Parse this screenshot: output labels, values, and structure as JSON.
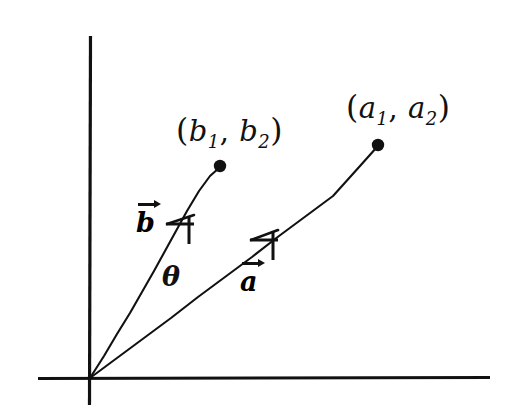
{
  "figure": {
    "kind": "vector-angle-diagram",
    "background_color": "#ffffff",
    "ink_color": "#111111",
    "width": 514,
    "height": 420
  },
  "axes": {
    "origin": {
      "x": 90,
      "y": 378
    },
    "x_axis": {
      "x1": 38,
      "y1": 378,
      "x2": 490,
      "y2": 378
    },
    "y_axis": {
      "x1": 90,
      "y1": 36,
      "x2": 90,
      "y2": 405
    }
  },
  "vectors": [
    {
      "id": "vector-b",
      "name": "b",
      "label": "b",
      "label_x": 136,
      "label_y": 203,
      "tip": {
        "x": 220,
        "y": 167
      },
      "point_label": {
        "open_paren": "(",
        "base1": "b",
        "sub1": "1",
        "comma": ",",
        "base2": "b",
        "sub2": "2",
        "close_paren": ")",
        "x": 176,
        "y": 115
      },
      "arrowhead": {
        "x": 185,
        "y": 228
      }
    },
    {
      "id": "vector-a",
      "name": "a",
      "label": "a",
      "label_x": 240,
      "label_y": 262,
      "tip": {
        "x": 378,
        "y": 145
      },
      "point_label": {
        "open_paren": "(",
        "base1": "a",
        "sub1": "1",
        "comma": ",",
        "base2": "a",
        "sub2": "2",
        "close_paren": ")",
        "x": 346,
        "y": 92
      },
      "arrowhead": {
        "x": 268,
        "y": 242
      }
    }
  ],
  "angle": {
    "symbol": "θ",
    "x": 162,
    "y": 263,
    "between": [
      "b",
      "a"
    ]
  }
}
